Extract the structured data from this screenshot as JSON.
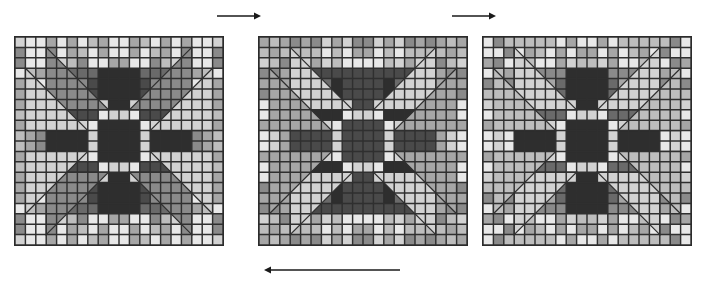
{
  "figure": {
    "title": "",
    "background_color": "#ffffff",
    "panel_count": 3,
    "grid": {
      "rows": 20,
      "cols": 20,
      "cell_size_px": 10.4
    }
  },
  "palette": {
    "gridline": "#2f2f2f",
    "outline": "#262626",
    "arrow": "#1a1a1a",
    "tones": {
      "t0": "#2e2e2e",
      "t1": "#4a4a4a",
      "t2": "#6a6a6a",
      "t3": "#8a8a8a",
      "t4": "#a6a6a6",
      "t5": "#bdbdbd",
      "t6": "#d2d2d2",
      "t7": "#e8e8e8"
    }
  },
  "arrows": [
    {
      "name": "arrow-panel1-to-panel2",
      "direction": "right",
      "x1": 217,
      "y1": 16,
      "x2": 261,
      "y2": 16,
      "label": ""
    },
    {
      "name": "arrow-panel2-to-panel3",
      "direction": "right",
      "x1": 452,
      "y1": 16,
      "x2": 496,
      "y2": 16,
      "label": ""
    },
    {
      "name": "arrow-panel3-to-panel1",
      "direction": "left",
      "x1": 400,
      "y1": 270,
      "x2": 264,
      "y2": 270,
      "label": ""
    }
  ],
  "panels": [
    {
      "name": "quilt-panel-1",
      "index": 1,
      "x": 14,
      "y": 36,
      "w": 208,
      "h": 208,
      "base_tone": "t3",
      "star_tone": "t0",
      "corner_block_tone": "t1",
      "triangle_tone": "t3",
      "triangle_inner_tone": "t6",
      "center_tone": "t0",
      "noise_seed": 11,
      "label": "pattern-state-A"
    },
    {
      "name": "quilt-panel-2",
      "index": 2,
      "x": 258,
      "y": 36,
      "w": 208,
      "h": 208,
      "base_tone": "t3",
      "star_tone": "t1",
      "corner_block_tone": "t0",
      "triangle_tone": "t6",
      "triangle_inner_tone": "t4",
      "center_tone": "t1",
      "noise_seed": 27,
      "label": "pattern-state-B"
    },
    {
      "name": "quilt-panel-3",
      "index": 3,
      "x": 482,
      "y": 36,
      "w": 208,
      "h": 208,
      "base_tone": "t3",
      "star_tone": "t0",
      "corner_block_tone": "t2",
      "triangle_tone": "t6",
      "triangle_inner_tone": "t5",
      "center_tone": "t0",
      "noise_seed": 43,
      "label": "pattern-state-C"
    }
  ]
}
